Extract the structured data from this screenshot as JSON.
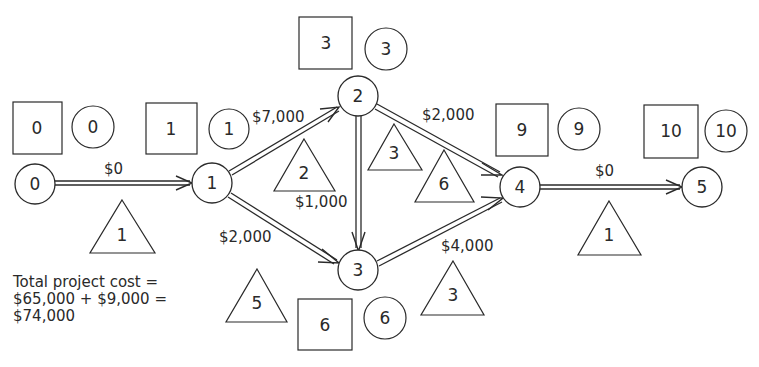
{
  "diagram": {
    "type": "activity-on-node network (crashing)",
    "nodes": [
      {
        "id": "0",
        "label": "0",
        "cx": 35,
        "cy": 184
      },
      {
        "id": "1",
        "label": "1",
        "cx": 212,
        "cy": 183
      },
      {
        "id": "2",
        "label": "2",
        "cx": 358,
        "cy": 96
      },
      {
        "id": "3",
        "label": "3",
        "cx": 358,
        "cy": 270
      },
      {
        "id": "4",
        "label": "4",
        "cx": 520,
        "cy": 187
      },
      {
        "id": "5",
        "label": "5",
        "cx": 702,
        "cy": 187
      }
    ],
    "edges": [
      {
        "from": "0",
        "to": "1",
        "cost": "$0",
        "duration": "1"
      },
      {
        "from": "1",
        "to": "2",
        "cost": "$7,000",
        "duration": "2"
      },
      {
        "from": "1",
        "to": "3",
        "cost": "$2,000",
        "duration": "5"
      },
      {
        "from": "2",
        "to": "3",
        "cost": "$1,000",
        "duration": "3"
      },
      {
        "from": "2",
        "to": "4",
        "cost": "$2,000",
        "duration": "6"
      },
      {
        "from": "3",
        "to": "4",
        "cost": "$4,000",
        "duration": "3"
      },
      {
        "from": "4",
        "to": "5",
        "cost": "$0",
        "duration": "1"
      }
    ],
    "event_times": [
      {
        "node": "0",
        "early_box": "0",
        "late_circle": "0"
      },
      {
        "node": "1",
        "early_box": "1",
        "late_circle": "1"
      },
      {
        "node": "2",
        "early_box": "3",
        "late_circle": "3"
      },
      {
        "node": "3",
        "early_box": "6",
        "late_circle": "6"
      },
      {
        "node": "4",
        "early_box": "9",
        "late_circle": "9"
      },
      {
        "node": "5",
        "early_box": "10",
        "late_circle": "10"
      }
    ],
    "note": {
      "line1": "Total project cost =",
      "line2": "$65,000 + $9,000 =",
      "line3": "$74,000"
    }
  }
}
